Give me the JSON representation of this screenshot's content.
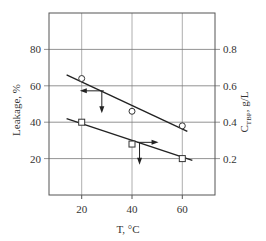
{
  "chart_data": {
    "type": "scatter",
    "title": "",
    "xlabel": "T, °C",
    "ylabel": "Leakage, %",
    "ylabel_right": "C_TBP, g/L",
    "ylabel_right_main": "C",
    "ylabel_right_sub": "TBP",
    "ylabel_right_unit": ", g/L",
    "xlim": [
      7,
      73
    ],
    "ylim": [
      0,
      100
    ],
    "ylim_right": [
      0.0,
      1.0
    ],
    "x_ticks": [
      20,
      40,
      60
    ],
    "y_ticks": [
      20,
      40,
      60,
      80
    ],
    "y_ticks_right": [
      0.2,
      0.4,
      0.6,
      0.8
    ],
    "x_tick_labels": [
      "20",
      "40",
      "60"
    ],
    "y_tick_labels": [
      "20",
      "40",
      "60",
      "80"
    ],
    "y_tick_labels_right": [
      "0.2",
      "0.4",
      "0.6",
      "0.8"
    ],
    "grid": true,
    "legend": null,
    "series": [
      {
        "name": "Leakage",
        "axis": "left",
        "marker": "circle",
        "x": [
          20,
          40,
          60
        ],
        "values": [
          64,
          46,
          38
        ],
        "fit_line": {
          "x": [
            14,
            62
          ],
          "y": [
            66,
            35
          ]
        },
        "axis_arrow": "left"
      },
      {
        "name": "C_TBP",
        "axis": "right",
        "marker": "square",
        "x": [
          20,
          40,
          60
        ],
        "values": [
          0.4,
          0.28,
          0.2
        ],
        "fit_line": {
          "x": [
            14,
            64
          ],
          "y": [
            0.42,
            0.19
          ]
        },
        "axis_arrow": "right"
      }
    ]
  }
}
